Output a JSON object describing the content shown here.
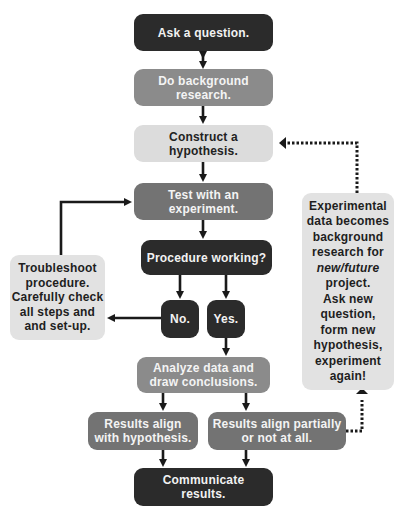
{
  "diagram": {
    "type": "flowchart",
    "colors": {
      "dark": "#2b2b2b",
      "mid": "#8b8b8b",
      "mid_dark": "#737373",
      "light": "#dcdcdc",
      "arrow": "#1a1a1a"
    },
    "nodes": {
      "ask": {
        "label": "Ask a question."
      },
      "research": {
        "label": "Do background\nresearch."
      },
      "hypothesis": {
        "label": "Construct a\nhypothesis."
      },
      "test": {
        "label": "Test with an\nexperiment."
      },
      "procedure": {
        "label": "Procedure working?"
      },
      "no": {
        "label": "No."
      },
      "yes": {
        "label": "Yes."
      },
      "analyze": {
        "label": "Analyze data and\ndraw conclusions."
      },
      "align": {
        "label": "Results align\nwith hypothesis."
      },
      "partial": {
        "label": "Results align partially\nor not at all."
      },
      "communicate": {
        "label": "Communicate\nresults."
      },
      "troubleshoot": {
        "label": "Troubleshoot\nprocedure.\nCarefully check\nall steps and\nand set-up."
      },
      "feedback": {
        "label_before": "Experimental\ndata becomes\nbackground\nresearch for",
        "label_emphasis": "new/future",
        "label_after": "project.\nAsk new\nquestion,\nform new\nhypothesis,\nexperiment\nagain!"
      }
    },
    "edges": [
      {
        "from": "ask",
        "to": "research",
        "style": "solid",
        "direction": "both"
      },
      {
        "from": "research",
        "to": "hypothesis",
        "style": "solid"
      },
      {
        "from": "hypothesis",
        "to": "test",
        "style": "solid"
      },
      {
        "from": "test",
        "to": "procedure",
        "style": "solid"
      },
      {
        "from": "procedure",
        "to": "no",
        "style": "solid"
      },
      {
        "from": "procedure",
        "to": "yes",
        "style": "solid"
      },
      {
        "from": "no",
        "to": "troubleshoot",
        "style": "solid"
      },
      {
        "from": "troubleshoot",
        "to": "test",
        "style": "solid"
      },
      {
        "from": "yes",
        "to": "analyze",
        "style": "solid"
      },
      {
        "from": "analyze",
        "to": "align",
        "style": "solid"
      },
      {
        "from": "analyze",
        "to": "partial",
        "style": "solid"
      },
      {
        "from": "align",
        "to": "communicate",
        "style": "solid"
      },
      {
        "from": "partial",
        "to": "communicate",
        "style": "solid"
      },
      {
        "from": "partial",
        "to": "feedback",
        "style": "dotted"
      },
      {
        "from": "feedback",
        "to": "hypothesis",
        "style": "dotted"
      }
    ]
  }
}
